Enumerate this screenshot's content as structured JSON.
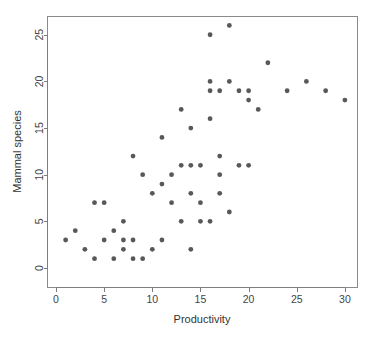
{
  "chart_data": {
    "type": "scatter",
    "title": "",
    "xlabel": "Productivity",
    "ylabel": "Mammal species",
    "xlim": [
      0,
      31
    ],
    "ylim": [
      0,
      26.8
    ],
    "xticks": [
      0,
      5,
      10,
      15,
      20,
      25,
      30
    ],
    "xtick_labels": [
      "0",
      "5",
      "10",
      "15",
      "20",
      "25",
      "30"
    ],
    "yticks": [
      0,
      5,
      10,
      15,
      20,
      25
    ],
    "ytick_labels": [
      "0",
      "5",
      "10",
      "15",
      "20",
      "25"
    ],
    "grid": false,
    "legend": null,
    "point_color": "#585858",
    "point_shape": "filled-circle",
    "point_size_px": 2.4,
    "axis_color": "#7d7d7d",
    "panel_border_color": "#8a8a8a",
    "background_color": "#ffffff",
    "x": [
      1,
      2,
      3,
      4,
      4,
      5,
      5,
      6,
      6,
      7,
      7,
      7,
      8,
      8,
      8,
      9,
      9,
      10,
      10,
      11,
      11,
      11,
      12,
      12,
      13,
      13,
      13,
      14,
      14,
      14,
      14,
      15,
      15,
      15,
      16,
      16,
      16,
      16,
      16,
      17,
      17,
      17,
      17,
      18,
      18,
      18,
      19,
      19,
      20,
      20,
      20,
      21,
      22,
      24,
      26,
      28,
      30
    ],
    "y": [
      3,
      4,
      2,
      7,
      1,
      7,
      3,
      4,
      1,
      5,
      2,
      3,
      12,
      3,
      1,
      10,
      1,
      8,
      2,
      14,
      9,
      3,
      10,
      7,
      17,
      11,
      5,
      15,
      11,
      8,
      2,
      7,
      5,
      11,
      25,
      20,
      19,
      16,
      5,
      19,
      12,
      10,
      8,
      26,
      20,
      6,
      19,
      11,
      19,
      18,
      11,
      17,
      22,
      19,
      20,
      19,
      18
    ],
    "n_points": 57,
    "series_name": "observations"
  },
  "labels": {
    "x_axis_title": "Productivity",
    "y_axis_title": "Mammal species"
  }
}
